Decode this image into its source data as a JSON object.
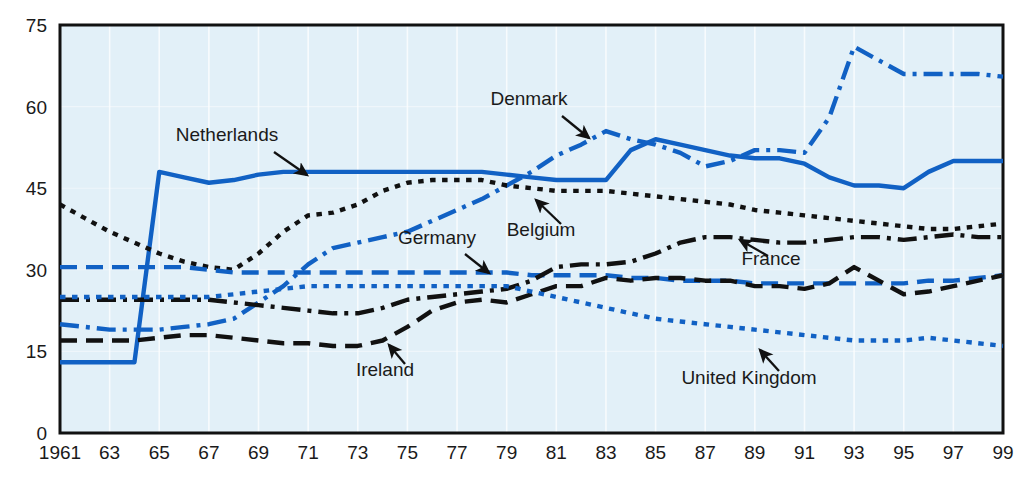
{
  "chart_data": {
    "type": "line",
    "title": "",
    "xlabel": "",
    "ylabel": "",
    "xlim": [
      1961,
      1999
    ],
    "ylim": [
      0,
      75
    ],
    "grid": true,
    "grid_note": "faint vertical gridlines every 2 years on light blue panel",
    "legend_position": "inline annotations with arrows",
    "ytick_labels": [
      "75",
      "60",
      "45",
      "30",
      "15",
      "0"
    ],
    "yticks": [
      75,
      60,
      45,
      30,
      15,
      0
    ],
    "xtick_labels": [
      "1961",
      "63",
      "65",
      "67",
      "69",
      "71",
      "73",
      "75",
      "77",
      "79",
      "81",
      "83",
      "85",
      "87",
      "89",
      "91",
      "93",
      "95",
      "97",
      "99"
    ],
    "xticks": [
      1961,
      1963,
      1965,
      1967,
      1969,
      1971,
      1973,
      1975,
      1977,
      1979,
      1981,
      1983,
      1985,
      1987,
      1989,
      1991,
      1993,
      1995,
      1997,
      1999
    ],
    "x": [
      1961,
      1962,
      1963,
      1964,
      1965,
      1966,
      1967,
      1968,
      1969,
      1970,
      1971,
      1972,
      1973,
      1974,
      1975,
      1976,
      1977,
      1978,
      1979,
      1980,
      1981,
      1982,
      1983,
      1984,
      1985,
      1986,
      1987,
      1988,
      1989,
      1990,
      1991,
      1992,
      1993,
      1994,
      1995,
      1996,
      1997,
      1998,
      1999
    ],
    "series": [
      {
        "name": "Netherlands",
        "color": "#1161c4",
        "style": "solid",
        "values": [
          13,
          13,
          13,
          13,
          48,
          47,
          46,
          46.5,
          47.5,
          48,
          48,
          48,
          48,
          48,
          48,
          48,
          48,
          48,
          47.5,
          47,
          46.5,
          46.5,
          46.5,
          52,
          54,
          53,
          52,
          51,
          50.5,
          50.5,
          49.5,
          47,
          45.5,
          45.5,
          45,
          48,
          50,
          50,
          50
        ]
      },
      {
        "name": "Denmark",
        "color": "#1161c4",
        "style": "dash-dot",
        "values": [
          20,
          19.5,
          19,
          19,
          19,
          19.5,
          20,
          21,
          24,
          27,
          31,
          34,
          35,
          36,
          37,
          39,
          41,
          43,
          45.5,
          48,
          51,
          53,
          55.5,
          54,
          53,
          51.5,
          49,
          50,
          52,
          52,
          51.5,
          58,
          71,
          68.5,
          66,
          66,
          66,
          66,
          65.5
        ]
      },
      {
        "name": "Belgium",
        "color": "#111111",
        "style": "dotted",
        "values": [
          42,
          39.5,
          37,
          35,
          33,
          31.5,
          30.5,
          30,
          33,
          37,
          40,
          40.5,
          42,
          44.5,
          46,
          46.5,
          46.5,
          46.5,
          45.5,
          45,
          44.5,
          44.5,
          44.5,
          44,
          43.5,
          43,
          42.5,
          42,
          41,
          40.5,
          40,
          39.5,
          39,
          38.5,
          38,
          37.5,
          37.5,
          38,
          38.5
        ]
      },
      {
        "name": "Germany",
        "color": "#1161c4",
        "style": "dashed",
        "values": [
          30.5,
          30.5,
          30.5,
          30.5,
          30.5,
          30.5,
          30,
          29.5,
          29.5,
          29.5,
          29.5,
          29.5,
          29.5,
          29.5,
          29.5,
          29.5,
          29.5,
          29.5,
          29.5,
          29,
          29,
          29,
          29,
          28.5,
          28.5,
          28,
          28,
          28,
          27.5,
          27.5,
          27.5,
          27.5,
          27.5,
          27.5,
          27.5,
          28,
          28,
          28.5,
          29
        ]
      },
      {
        "name": "France",
        "color": "#111111",
        "style": "dash-dot",
        "values": [
          24.5,
          24.5,
          24.5,
          24.5,
          24.5,
          24.5,
          24.5,
          24,
          23.5,
          23,
          22.5,
          22,
          22,
          23,
          24.5,
          25,
          25.5,
          26,
          26.5,
          28,
          30.5,
          31,
          31,
          31.5,
          33,
          35,
          36,
          36,
          35.5,
          35,
          35,
          35.5,
          36,
          36,
          35.5,
          36,
          36.5,
          36,
          36
        ]
      },
      {
        "name": "Ireland",
        "color": "#111111",
        "style": "dashed",
        "values": [
          17,
          17,
          17,
          17,
          17.5,
          18,
          18,
          17.5,
          17,
          16.5,
          16.5,
          16,
          16,
          17,
          19.5,
          22.5,
          24,
          24.5,
          24,
          25.5,
          27,
          27,
          28.5,
          28,
          28.5,
          28.5,
          28,
          28,
          27,
          27,
          26.5,
          27.5,
          30.5,
          28,
          25.5,
          26,
          27,
          28,
          29
        ]
      },
      {
        "name": "United Kingdom",
        "color": "#1161c4",
        "style": "dotted",
        "values": [
          25,
          25,
          25,
          25,
          25,
          25,
          25,
          25.5,
          26,
          26.5,
          27,
          27,
          27,
          27,
          27,
          27,
          27,
          27,
          27,
          26,
          25,
          24,
          23,
          22,
          21,
          20.5,
          20,
          19.5,
          19,
          18.5,
          18,
          17.5,
          17,
          17,
          17,
          17.5,
          17,
          16.5,
          16
        ]
      }
    ],
    "annotations": [
      {
        "label": "Netherlands",
        "label_x": 227,
        "label_y": 141,
        "arrow_from_x": 274,
        "arrow_from_y": 152,
        "arrow_to_x": 307,
        "arrow_to_y": 175
      },
      {
        "label": "Denmark",
        "label_x": 529,
        "label_y": 105,
        "arrow_from_x": 562,
        "arrow_from_y": 116,
        "arrow_to_x": 589,
        "arrow_to_y": 138
      },
      {
        "label": "Belgium",
        "label_x": 541,
        "label_y": 236,
        "arrow_from_x": 561,
        "arrow_from_y": 224,
        "arrow_to_x": 536,
        "arrow_to_y": 200
      },
      {
        "label": "Germany",
        "label_x": 437,
        "label_y": 244,
        "arrow_from_x": 465,
        "arrow_from_y": 254,
        "arrow_to_x": 489,
        "arrow_to_y": 273
      },
      {
        "label": "France",
        "label_x": 771,
        "label_y": 265,
        "arrow_from_x": 768,
        "arrow_from_y": 256,
        "arrow_to_x": 740,
        "arrow_to_y": 240
      },
      {
        "label": "Ireland",
        "label_x": 385,
        "label_y": 376,
        "arrow_from_x": 405,
        "arrow_from_y": 364,
        "arrow_to_x": 389,
        "arrow_to_y": 345
      },
      {
        "label": "United Kingdom",
        "label_x": 749,
        "label_y": 384,
        "arrow_from_x": 779,
        "arrow_from_y": 371,
        "arrow_to_x": 760,
        "arrow_to_y": 350
      }
    ]
  },
  "style": {
    "panel_background": "#e2f0f8",
    "panel_border": "#111111",
    "blue": "#1161c4",
    "black": "#111111",
    "page_background": "#ffffff"
  }
}
